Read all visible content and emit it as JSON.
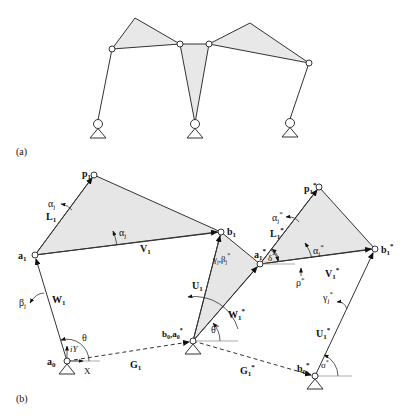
{
  "figure": {
    "panel_a": {
      "label": "(a)",
      "description": "Planar linkage with three ground pivots and three shaded triangular links"
    },
    "panel_b": {
      "label": "(b)",
      "points": {
        "a0": "a",
        "a0_sub": "0",
        "a1": "a",
        "a1_sub": "1",
        "p1": "p",
        "p1_sub": "1",
        "b1": "b",
        "b1_sub": "1",
        "b0a0star": "b",
        "b0a0star_sub": "0",
        "b0a0star_mid": ",a",
        "b0a0star_sub2": "0",
        "a1star": "a",
        "a1star_sub": "1",
        "p1star": "p",
        "p1star_sub": "1",
        "b1star": "b",
        "b1star_sub": "1",
        "b0star": "b",
        "b0star_sub": "0"
      },
      "vectors": {
        "W1": "W",
        "W1_sub": "1",
        "L1": "L",
        "L1_sub": "1",
        "V1": "V",
        "V1_sub": "1",
        "U1": "U",
        "U1_sub": "1",
        "G1": "G",
        "G1_sub": "1",
        "W1star": "W",
        "W1star_sub": "1",
        "L1star": "L",
        "L1star_sub": "1",
        "V1star": "V",
        "V1star_sub": "1",
        "U1star": "U",
        "U1star_sub": "1",
        "G1star": "G",
        "G1star_sub": "1"
      },
      "angles": {
        "alpha_j_outer": "α",
        "alpha_j_outer_sub": "j",
        "alpha_j_inner": "α",
        "alpha_j_inner_sub": "j",
        "beta_j": "β",
        "beta_j_sub": "j",
        "gamma_beta": "γ",
        "gamma_beta_sub": "j",
        "gamma_beta_mid": ",β",
        "gamma_beta_sub2": "j",
        "theta": "θ",
        "theta_star": "θ",
        "delta_star": "δ",
        "rho_star": "ρ",
        "sigma_star": "σ",
        "alpha_j_star_outer": "α",
        "alpha_j_star_outer_sub": "j",
        "alpha_j_star_inner": "α",
        "alpha_j_star_inner_sub": "j",
        "gamma_j_star": "γ",
        "gamma_j_star_sub": "j",
        "star": "*"
      },
      "axes": {
        "x_label": "X",
        "y_label": "iY"
      }
    }
  },
  "colors": {
    "line": "#333333",
    "fill": "#e6e6e6",
    "background": "#ffffff"
  }
}
